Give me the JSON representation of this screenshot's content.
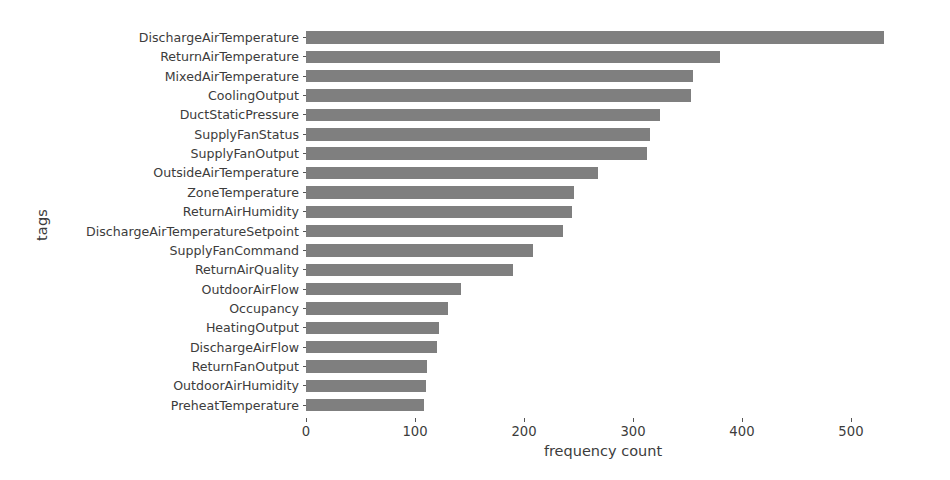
{
  "chart_data": {
    "type": "bar",
    "orientation": "horizontal",
    "title": "",
    "xlabel": "frequency count",
    "ylabel": "tags",
    "xlim": [
      0,
      545
    ],
    "xticks": [
      0,
      100,
      200,
      300,
      400,
      500
    ],
    "xtick_labels": [
      "0",
      "100",
      "200",
      "300",
      "400",
      "500"
    ],
    "grid": false,
    "legend": null,
    "bar_color": "#7f7f7f",
    "categories": [
      "DischargeAirTemperature",
      "ReturnAirTemperature",
      "MixedAirTemperature",
      "CoolingOutput",
      "DuctStaticPressure",
      "SupplyFanStatus",
      "SupplyFanOutput",
      "OutsideAirTemperature",
      "ZoneTemperature",
      "ReturnAirHumidity",
      "DischargeAirTemperatureSetpoint",
      "SupplyFanCommand",
      "ReturnAirQuality",
      "OutdoorAirFlow",
      "Occupancy",
      "HeatingOutput",
      "DischargeAirFlow",
      "ReturnFanOutput",
      "OutdoorAirHumidity",
      "PreheatTemperature"
    ],
    "values": [
      530,
      380,
      355,
      353,
      325,
      316,
      313,
      268,
      246,
      244,
      236,
      208,
      190,
      142,
      130,
      122,
      120,
      111,
      110,
      108
    ]
  }
}
